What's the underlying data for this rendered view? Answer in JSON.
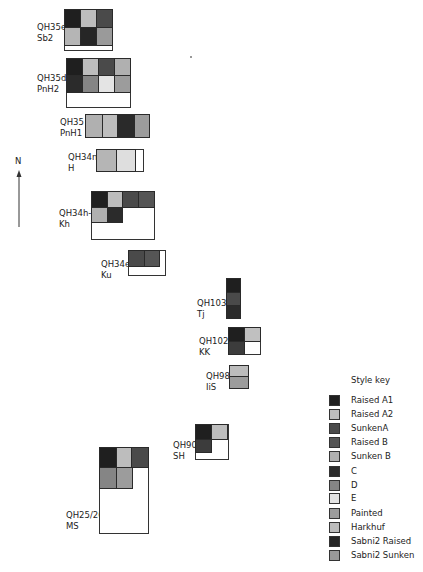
{
  "north": {
    "label": "N"
  },
  "colors": {
    "raised_a1": "#1f1f1f",
    "raised_a2": "#bdbdbd",
    "sunken_a": "#4a4a4a",
    "raised_b": "#555555",
    "sunken_b": "#b0b0b0",
    "c": "#2b2b2b",
    "d": "#858585",
    "e": "#e4e4e4",
    "painted": "#9c9c9c",
    "harkhuf": "#bcbcbc",
    "sabni2_raised": "#262626",
    "sabni2_sunken": "#9a9a9a"
  },
  "tombs": [
    {
      "id": "QH35e",
      "owner": "Sb2"
    },
    {
      "id": "QH35d",
      "owner": "PnH2"
    },
    {
      "id": "QH35",
      "owner": "PnH1"
    },
    {
      "id": "QH34n",
      "owner": "H"
    },
    {
      "id": "QH34h-i",
      "owner": "Kh"
    },
    {
      "id": "QH34e",
      "owner": "Ku"
    },
    {
      "id": "QH103",
      "owner": "Tj"
    },
    {
      "id": "QH102",
      "owner": "KK"
    },
    {
      "id": "QH98",
      "owner": "IiS"
    },
    {
      "id": "QH90",
      "owner": "SH"
    },
    {
      "id": "QH25/26",
      "owner": "MS"
    }
  ],
  "legend": {
    "title": "Style key",
    "items": [
      {
        "label": "Raised A1",
        "color": "#1f1f1f"
      },
      {
        "label": "Raised A2",
        "color": "#bdbdbd"
      },
      {
        "label": "SunkenA",
        "color": "#4a4a4a"
      },
      {
        "label": "Raised B",
        "color": "#555555"
      },
      {
        "label": "Sunken B",
        "color": "#b0b0b0"
      },
      {
        "label": "C",
        "color": "#2b2b2b"
      },
      {
        "label": "D",
        "color": "#858585"
      },
      {
        "label": "E",
        "color": "#e4e4e4"
      },
      {
        "label": "Painted",
        "color": "#9c9c9c"
      },
      {
        "label": "Harkhuf",
        "color": "#bcbcbc"
      },
      {
        "label": "Sabni2 Raised",
        "color": "#262626"
      },
      {
        "label": "Sabni2 Sunken",
        "color": "#9a9a9a"
      }
    ]
  }
}
